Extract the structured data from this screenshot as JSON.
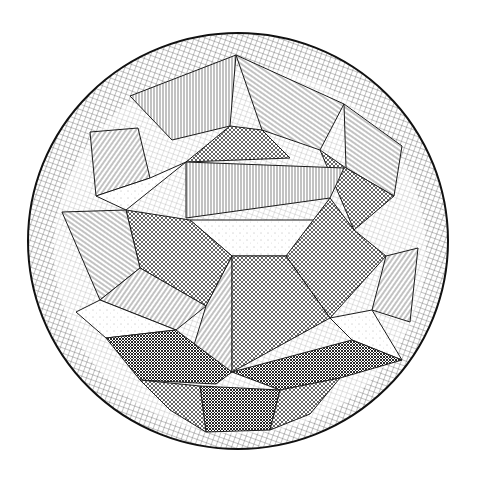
{
  "illustration": {
    "subject": "stellated polyhedron inside a cross-hatched sphere",
    "style": "black-and-white line engraving",
    "colors": {
      "background": "#ffffff",
      "ink": "#1a1a1a",
      "ink_light": "#555555"
    },
    "sphere": {
      "cx": 238,
      "cy": 241,
      "rx": 210,
      "ry": 208
    },
    "inner_clear_ring": {
      "cx": 238,
      "cy": 241,
      "rx": 182,
      "ry": 180
    },
    "facets": [
      {
        "name": "top-apex-left",
        "fill": "hatchV",
        "points": "236,55 130,96 172,140 230,126"
      },
      {
        "name": "top-apex-right",
        "fill": "hatchDiagR",
        "points": "236,55 344,104 320,150 262,130"
      },
      {
        "name": "top-inner-dark",
        "fill": "cross",
        "points": "230,126 262,130 290,158 186,162"
      },
      {
        "name": "upper-left-wing",
        "fill": "hatchDiagL",
        "points": "90,132 138,128 150,178 96,196"
      },
      {
        "name": "upper-left-wing-b",
        "fill": "dots",
        "points": "96,196 150,178 186,162 126,210"
      },
      {
        "name": "upper-right-wing",
        "fill": "hatchDiagR",
        "points": "344,104 402,146 394,196 346,168"
      },
      {
        "name": "upper-right-wing-b",
        "fill": "cross",
        "points": "320,150 346,168 394,196 354,230"
      },
      {
        "name": "center-band",
        "fill": "hatchV",
        "points": "186,162 344,168 330,198 186,218"
      },
      {
        "name": "center-light",
        "fill": "dots",
        "points": "190,220 330,220 286,256 232,256"
      },
      {
        "name": "center-left-dark",
        "fill": "cross",
        "points": "126,210 190,220 232,256 206,306 140,268"
      },
      {
        "name": "center-right-dark",
        "fill": "cross",
        "points": "330,198 354,230 386,256 330,318 286,256"
      },
      {
        "name": "center-down-left",
        "fill": "hatchDiagL",
        "points": "206,306 232,256 232,372 190,358"
      },
      {
        "name": "center-down-right",
        "fill": "cross",
        "points": "232,256 286,256 330,318 232,372"
      },
      {
        "name": "left-mid-a",
        "fill": "hatchDiagR",
        "points": "62,212 126,210 140,268 100,300"
      },
      {
        "name": "left-mid-b",
        "fill": "hatchDiagL",
        "points": "100,300 140,268 206,306 176,330"
      },
      {
        "name": "left-lower-light",
        "fill": "dots",
        "points": "76,312 100,300 176,330 106,338"
      },
      {
        "name": "right-mid-a",
        "fill": "hatchDiagL",
        "points": "386,256 418,248 410,322 372,310"
      },
      {
        "name": "right-mid-b",
        "fill": "dots",
        "points": "330,318 372,310 402,360 352,340"
      },
      {
        "name": "lower-left-shadow",
        "fill": "crossDense",
        "points": "106,338 176,330 232,372 216,384 140,380"
      },
      {
        "name": "lower-right-shadow",
        "fill": "crossDense",
        "points": "232,372 352,340 402,360 340,378 280,390"
      },
      {
        "name": "bottom-apex",
        "fill": "crossDense",
        "points": "200,386 280,390 270,430 206,432"
      },
      {
        "name": "bottom-left-wing",
        "fill": "cross",
        "points": "140,380 200,386 206,432 170,410"
      },
      {
        "name": "bottom-right-wing",
        "fill": "cross",
        "points": "280,390 340,378 310,414 270,430"
      }
    ]
  }
}
